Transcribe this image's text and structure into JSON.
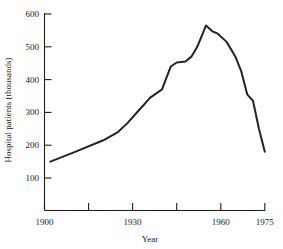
{
  "chart_data": {
    "type": "line",
    "title": "",
    "xlabel": "Year",
    "ylabel": "Hospital patients (thousands)",
    "xlim": [
      1900,
      1975
    ],
    "ylim": [
      0,
      600
    ],
    "xticks": [
      1900,
      1915,
      1930,
      1945,
      1960,
      1975
    ],
    "xtick_labels": [
      "1900",
      "",
      "1930",
      "",
      "1960",
      "1975"
    ],
    "yticks": [
      100,
      200,
      300,
      400,
      500,
      600
    ],
    "ytick_labels": [
      "100",
      "200",
      "300",
      "400",
      "500",
      "600"
    ],
    "grid": false,
    "legend": null,
    "x": [
      1902,
      1910,
      1920,
      1925,
      1928,
      1932,
      1936,
      1940,
      1943,
      1945,
      1948,
      1950,
      1952,
      1955,
      1957,
      1959,
      1962,
      1965,
      1967,
      1969,
      1971,
      1973,
      1975
    ],
    "values": [
      150,
      178,
      215,
      240,
      265,
      305,
      345,
      370,
      440,
      452,
      455,
      470,
      500,
      565,
      548,
      540,
      515,
      470,
      425,
      355,
      335,
      250,
      180
    ],
    "series": [
      {
        "name": "Hospital patients",
        "values": [
          150,
          178,
          215,
          240,
          265,
          305,
          345,
          370,
          440,
          452,
          455,
          470,
          500,
          565,
          548,
          540,
          515,
          470,
          425,
          355,
          335,
          250,
          180
        ]
      }
    ],
    "annotations": []
  },
  "axes": {
    "x_axis_label": "Year",
    "y_axis_label": "Hospital patients (thousands)"
  }
}
